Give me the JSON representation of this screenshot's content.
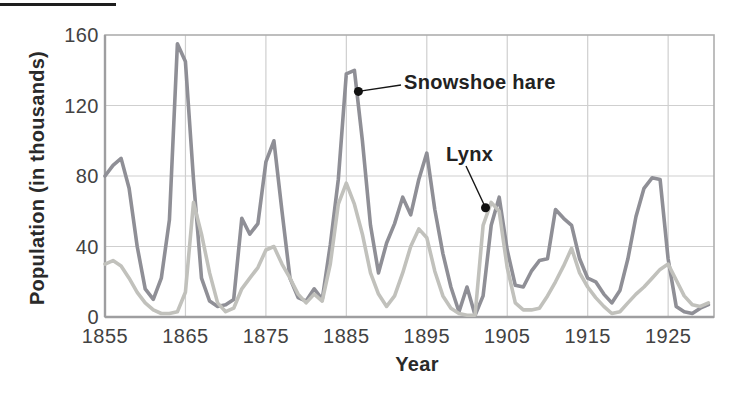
{
  "figure": {
    "y_axis_title": "Population (in thousands)",
    "x_axis_title": "Year"
  },
  "colors": {
    "hare_line": "#8f8f96",
    "lynx_line": "#c1c1bc",
    "gridline": "#cfcfcf",
    "frame": "#aeaeae",
    "axis_edge": "#9e9ea0",
    "annotation_line": "#151515",
    "annotation_dot": "#111111",
    "text": "#424242"
  },
  "chart_data": {
    "type": "line",
    "title": "",
    "xlabel": "Year",
    "ylabel": "Population (in thousands)",
    "xlim": [
      1855,
      1930.7
    ],
    "ylim": [
      0,
      160
    ],
    "xticks": [
      1855,
      1865,
      1875,
      1885,
      1895,
      1905,
      1915,
      1925
    ],
    "yticks": [
      0,
      40,
      80,
      120,
      160
    ],
    "grid": true,
    "legend_position": "inline-annotations",
    "x": [
      1855,
      1856,
      1857,
      1858,
      1859,
      1860,
      1861,
      1862,
      1863,
      1864,
      1865,
      1866,
      1867,
      1868,
      1869,
      1870,
      1871,
      1872,
      1873,
      1874,
      1875,
      1876,
      1877,
      1878,
      1879,
      1880,
      1881,
      1882,
      1883,
      1884,
      1885,
      1886,
      1887,
      1888,
      1889,
      1890,
      1891,
      1892,
      1893,
      1894,
      1895,
      1896,
      1897,
      1898,
      1899,
      1900,
      1901,
      1902,
      1903,
      1904,
      1905,
      1906,
      1907,
      1908,
      1909,
      1910,
      1911,
      1912,
      1913,
      1914,
      1915,
      1916,
      1917,
      1918,
      1919,
      1920,
      1921,
      1922,
      1923,
      1924,
      1925,
      1926,
      1927,
      1928,
      1929,
      1930
    ],
    "series": [
      {
        "name": "Snowshoe hare",
        "color": "#8f8f96",
        "values": [
          80,
          86,
          90,
          73,
          40,
          16,
          10,
          22,
          55,
          155,
          145,
          78,
          22,
          9,
          6,
          7,
          10,
          56,
          47,
          53,
          88,
          100,
          60,
          22,
          11,
          9,
          16,
          10,
          41,
          78,
          138,
          140,
          100,
          52,
          25,
          42,
          53,
          68,
          58,
          78,
          93,
          61,
          36,
          17,
          3,
          17,
          1,
          12,
          52,
          68,
          38,
          18,
          17,
          26,
          32,
          33,
          61,
          56,
          52,
          33,
          22,
          20,
          13,
          8,
          15,
          33,
          57,
          73,
          79,
          78,
          33,
          6,
          3,
          2,
          5,
          7
        ]
      },
      {
        "name": "Lynx",
        "color": "#c1c1bc",
        "values": [
          30,
          32,
          29,
          22,
          14,
          8,
          4,
          2,
          2,
          3,
          14,
          65,
          47,
          25,
          8,
          3,
          5,
          16,
          22,
          28,
          38,
          40,
          30,
          22,
          13,
          8,
          13,
          9,
          30,
          64,
          76,
          64,
          47,
          25,
          13,
          6,
          12,
          25,
          40,
          50,
          45,
          26,
          12,
          5,
          2,
          1,
          1,
          52,
          65,
          60,
          28,
          8,
          4,
          4,
          5,
          12,
          20,
          29,
          39,
          25,
          17,
          11,
          6,
          2,
          3,
          8,
          13,
          17,
          22,
          27,
          30,
          21,
          12,
          7,
          6,
          8
        ]
      }
    ],
    "annotations": [
      {
        "label": "Snowshoe hare",
        "series": "Snowshoe hare",
        "anchor_year": 1886.5,
        "anchor_value": 128
      },
      {
        "label": "Lynx",
        "series": "Lynx",
        "anchor_year": 1902.3,
        "anchor_value": 62
      }
    ]
  }
}
